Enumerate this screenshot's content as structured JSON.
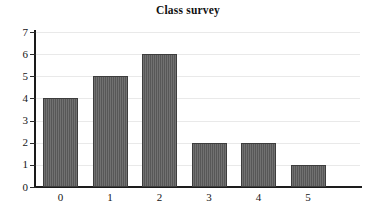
{
  "chart_data": {
    "type": "bar",
    "title": "Class survey",
    "categories": [
      "0",
      "1",
      "2",
      "3",
      "4",
      "5"
    ],
    "values": [
      4,
      5,
      6,
      2,
      2,
      1
    ],
    "xlabel": "",
    "ylabel": "",
    "ylim": [
      0,
      7
    ],
    "yticks": [
      0,
      1,
      2,
      3,
      4,
      5,
      6,
      7
    ],
    "ytick_labels": [
      "0",
      "1",
      "2",
      "3",
      "4",
      "5",
      "6",
      "7"
    ],
    "grid": true,
    "grid_axis": "y",
    "legend": false,
    "bar_color": "#5c5c5c",
    "bar_edge_color": "#3d3d3d",
    "grid_color": "#e9e9e9",
    "axis_color": "#1a1a1a",
    "background_color": "#ffffff"
  }
}
